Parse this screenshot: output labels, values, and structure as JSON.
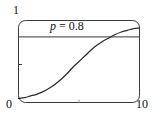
{
  "chart_data": {
    "type": "line",
    "title": "",
    "subtitle": "",
    "xlabel": "",
    "ylabel": "",
    "xlim": [
      0,
      10
    ],
    "ylim": [
      0,
      1
    ],
    "grid": false,
    "legend_position": "none",
    "frame": "rounded-rectangle",
    "x_tick_labels": [
      "0",
      "10"
    ],
    "y_tick_labels": [
      "0",
      "1"
    ],
    "x_ticks": [
      0,
      5,
      10
    ],
    "y_ticks": [
      0,
      0.5,
      1
    ],
    "annotations": [
      {
        "name": "threshold-label",
        "symbol": "p",
        "relation": "=",
        "value": "0.8",
        "text": "p = 0.8",
        "x": 4.1,
        "y": 0.93
      }
    ],
    "series": [
      {
        "name": "threshold-line",
        "type": "hline",
        "y": 0.8,
        "color": "#333333",
        "x": [
          0,
          10
        ],
        "values": [
          0.8,
          0.8
        ]
      },
      {
        "name": "sigmoid-curve",
        "type": "line",
        "color": "#2b2b2b",
        "x": [
          0.0,
          0.5,
          1.0,
          1.5,
          2.0,
          2.5,
          3.0,
          3.5,
          4.0,
          4.5,
          5.0,
          5.5,
          6.0,
          6.5,
          7.0,
          7.5,
          8.0,
          8.5,
          9.0,
          9.5,
          10.0
        ],
        "values": [
          0.05,
          0.06,
          0.08,
          0.1,
          0.13,
          0.17,
          0.22,
          0.28,
          0.35,
          0.43,
          0.5,
          0.57,
          0.64,
          0.7,
          0.75,
          0.79,
          0.83,
          0.86,
          0.88,
          0.9,
          0.91
        ]
      }
    ]
  },
  "axes": {
    "y_max_label": "1",
    "y_min_label": "0",
    "x_max_label": "10"
  },
  "annotation": {
    "symbol": "p",
    "rest": " = 0.8"
  },
  "colors": {
    "frame": "#3a3a3a",
    "curve": "#2b2b2b",
    "threshold": "#333333",
    "text": "#111111",
    "background": "#ffffff"
  }
}
